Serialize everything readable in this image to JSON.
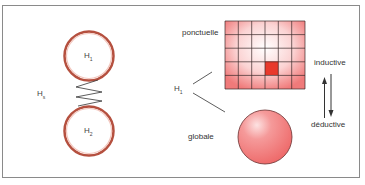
{
  "left_panel": {
    "top_sphere_label": "H",
    "top_sphere_sub": "1",
    "bottom_sphere_label": "H",
    "bottom_sphere_sub": "2",
    "spring_label": "H",
    "spring_sub": "s"
  },
  "right_panel": {
    "source_label": "H",
    "source_sub": "1",
    "grid_label": "ponctuelle",
    "sphere_label": "globale",
    "grid": {
      "columns": 6,
      "rows": 5,
      "highlight_column": 4,
      "highlight_row": 4
    },
    "arrow_up_label": "inductive",
    "arrow_down_label": "déductive"
  },
  "colors": {
    "frame": "#8a8a8a",
    "sphere_outline": "#b04a3a",
    "grid_fill": "#f08080",
    "highlight": "#e8392c",
    "globe_fill": "#f07070"
  }
}
